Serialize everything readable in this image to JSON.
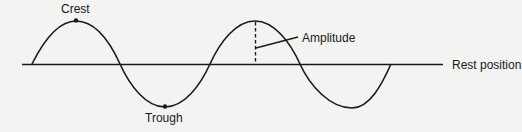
{
  "diagram": {
    "labels": {
      "crest": "Crest",
      "trough": "Trough",
      "amplitude": "Amplitude",
      "rest_position": "Rest position"
    },
    "colors": {
      "line": "#1a1a1a",
      "background": "#f3f3f1"
    }
  }
}
